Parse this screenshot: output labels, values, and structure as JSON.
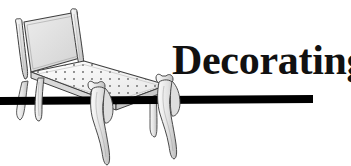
{
  "banner": {
    "heading": "Decorating",
    "heading_color": "#111111",
    "background_color": "#ffffff"
  },
  "rule": {
    "name": "horizontal-rule",
    "color": "#000000",
    "left_x": 0,
    "right_x": 313,
    "thickness": 8
  },
  "illustration": {
    "subject": "antique-chair",
    "style": "line-art",
    "outline_color": "#3c3c3c",
    "fill_light": "#f2f2f2",
    "fill_mid": "#dcdcdc",
    "fill_shadow": "#bdbdbd",
    "seat_dot_color": "#6b6b6b",
    "parts": [
      "chair-back-panel",
      "left-back-post",
      "right-back-post",
      "seat",
      "left-rear-leg",
      "left-front-leg",
      "right-front-leg",
      "right-rear-leg"
    ]
  }
}
